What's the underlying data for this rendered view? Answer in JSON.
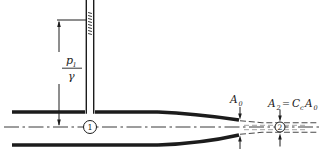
{
  "figure": {
    "colors": {
      "ink": "#1c1c1c",
      "centerline": "#3a3a3a",
      "jet_line": "#4a4a4a",
      "jet_line_faint": "#8a8a8a",
      "background": "#ffffff"
    },
    "labels": {
      "pressure_head": {
        "numerator_base": "p",
        "numerator_sub": "1",
        "denominator": "γ"
      },
      "station_1": "1",
      "station_2": "2",
      "orifice_area": {
        "base": "A",
        "sub": "0"
      },
      "jet_area_equation": {
        "lhs_base": "A",
        "lhs_sub": "2",
        "equals": "=",
        "coefficient_base": "C",
        "coefficient_sub": "c",
        "rhs_base": "A",
        "rhs_sub": "0"
      }
    }
  }
}
